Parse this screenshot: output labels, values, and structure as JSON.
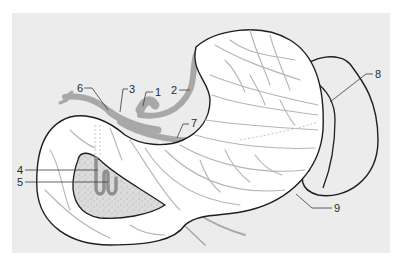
{
  "diagram": {
    "colors": {
      "background_panel": "#ececec",
      "organ_fill": "#ffffff",
      "outline": "#1e1e1e",
      "vessel": "#a8a8a8",
      "vessel_fine": "#b5b5b5",
      "stippled_region": "#dcdcdc",
      "label_text": "#2a2a2a"
    },
    "labels": [
      {
        "id": "1",
        "text": "1",
        "x": 155,
        "y": 87
      },
      {
        "id": "2",
        "text": "2",
        "x": 171,
        "y": 85
      },
      {
        "id": "3",
        "text": "3",
        "x": 129,
        "y": 84
      },
      {
        "id": "4",
        "text": "4",
        "x": 17,
        "y": 165
      },
      {
        "id": "5",
        "text": "5",
        "x": 17,
        "y": 177
      },
      {
        "id": "6",
        "text": "6",
        "x": 77,
        "y": 83
      },
      {
        "id": "7",
        "text": "7",
        "x": 191,
        "y": 118
      },
      {
        "id": "8",
        "text": "8",
        "x": 375,
        "y": 69
      },
      {
        "id": "9",
        "text": "9",
        "x": 334,
        "y": 203
      }
    ],
    "structures": [
      {
        "name": "stomach",
        "description": "J-shaped stomach outline with fundus top right"
      },
      {
        "name": "spleen",
        "description": "crescent-shaped organ to the right of the stomach"
      },
      {
        "name": "pylorus-duodenum",
        "description": "stippled inner region at lower left"
      },
      {
        "name": "celiac-trunk",
        "description": "gray vessel trunk above lesser curvature"
      }
    ]
  }
}
